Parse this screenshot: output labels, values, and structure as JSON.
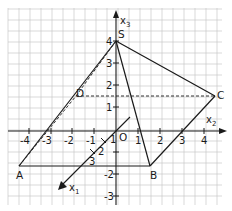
{
  "diagram": {
    "type": "3d-pyramid-coordinate-sketch",
    "origin_label": "O",
    "axes": {
      "x1": {
        "label": "x",
        "subscript": "1",
        "ticks": [
          "1",
          "2",
          "3"
        ]
      },
      "x2": {
        "label": "x",
        "subscript": "2",
        "ticks": [
          "-4",
          "-3",
          "-2",
          "-1",
          "1",
          "2",
          "3",
          "4"
        ]
      },
      "x3": {
        "label": "x",
        "subscript": "3",
        "ticks": [
          "4",
          "3",
          "2",
          "1",
          "-2",
          "-3"
        ]
      }
    },
    "points": {
      "S": "S",
      "A": "A",
      "B": "B",
      "C": "C",
      "D": "D"
    },
    "colors": {
      "grid": "#c8c8c8",
      "lines": "#1a1a1a",
      "background": "#ffffff"
    }
  }
}
